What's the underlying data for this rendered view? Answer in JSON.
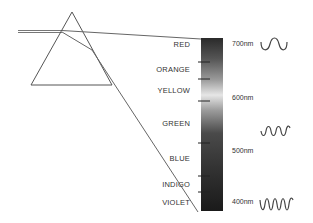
{
  "colors": [
    {
      "name": "RED",
      "y": 45
    },
    {
      "name": "ORANGE",
      "y": 70
    },
    {
      "name": "YELLOW",
      "y": 91
    },
    {
      "name": "GREEN",
      "y": 124
    },
    {
      "name": "BLUE",
      "y": 159
    },
    {
      "name": "INDIGO",
      "y": 185
    },
    {
      "name": "VIOLET",
      "y": 203
    }
  ],
  "wavelengths": [
    {
      "label": "700nm",
      "y": 45
    },
    {
      "label": "600nm",
      "y": 99
    },
    {
      "label": "500nm",
      "y": 152
    },
    {
      "label": "400nm",
      "y": 203
    }
  ],
  "waves": [
    {
      "wavelength": "700nm",
      "cycles": 1.5
    },
    {
      "wavelength": "500nm",
      "cycles": 2.5
    },
    {
      "wavelength": "400nm",
      "cycles": 3.5
    }
  ],
  "palette": {
    "line": "#555555",
    "text": "#333333",
    "spectrum_dark": "#1e1e1e",
    "spectrum_light": "#e8e8e8"
  }
}
